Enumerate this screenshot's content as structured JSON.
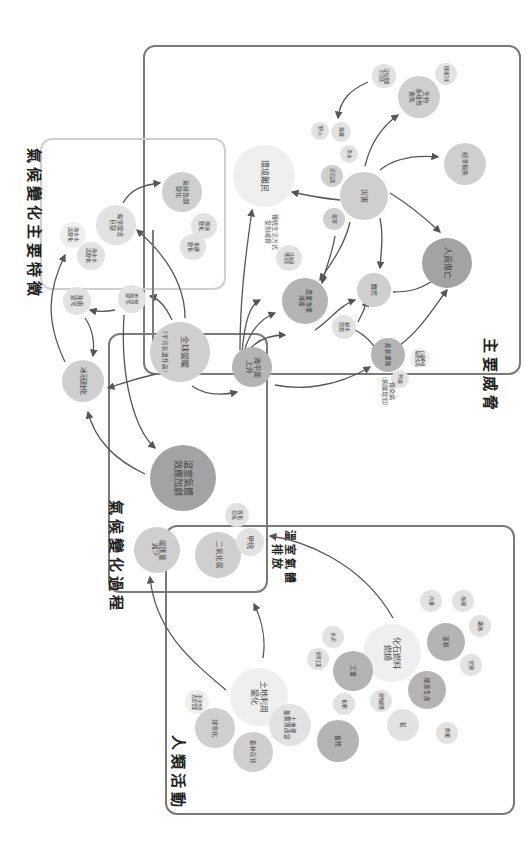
{
  "sections": {
    "features": "氣候變化主要特徵",
    "threats": "主要威脅",
    "process": "氣候變化過程",
    "ghg_emission": "溫室氣體\n排放",
    "human": "人類活動"
  },
  "nodes": {
    "ice_melt": "冰冠融化",
    "precip_change": "降雨\n變化",
    "sea_temp_change": "海水水\n溫變化",
    "ocean_current": "海洋環流\n巨變",
    "sea_level_change": "海水水\n溫變化",
    "cloud_change": "雲層\n變化",
    "extreme_weather": "氣候急劇\n變化",
    "wind_change": "風速\n變化",
    "season_change": "季節\n變化",
    "global_warming": "全球變暖",
    "global_warming_sub": "（平均氣溫升高）",
    "sea_level_rise": "海平面\n上升",
    "greenhouse_effect": "溫室氣體\n效應加劇",
    "carbon_sink": "碳匯量\n減少",
    "co2": "二氧化碳",
    "methane": "甲烷",
    "nitrous_oxide": "氧化\n亞氮",
    "env_refugees": "環境難民",
    "disaster": "災害",
    "fire": "野火",
    "drought": "乾旱",
    "flood": "洪水",
    "storm": "風暴",
    "landslide": "泥石流",
    "biodiversity": "生物\n多樣性\n喪失",
    "coral": "珊瑚白化",
    "habitat_loss": "沒有適應\n的消失",
    "economic_loss": "經濟損失",
    "human_death": "人員傷亡",
    "agri_fishery": "農業漁業\n減產",
    "hunger": "饑荒",
    "water_shortage": "缺水\n問題",
    "disease": "疾病擴散",
    "lifestyle_change": "傳統生活方式\n受到威脅",
    "coast_erosion": "沿海濕\n地消失",
    "heatwave": "熱浪",
    "vector_disease": "傳染病\n（病媒增加）",
    "respiratory": "心臟呼吸\n系統疾病",
    "land_use": "土地利用\n變化",
    "urbanisation": "城市化",
    "impervious": "不可滲透\n表面增加",
    "deforestation": "森林砍伐",
    "land_cover": "土地覆\n蓋類別改變",
    "fossil_fuel": "化石燃料\n燃燒",
    "industry": "工業",
    "chemical": "化學工業",
    "cement": "水泥",
    "fertiliser": "化肥",
    "livestock": "畜牧",
    "waste": "廢物處理",
    "energy": "能源生產",
    "rice": "稻",
    "transport": "運輸",
    "car": "汽車",
    "shipping": "海運",
    "rail": "鐵路",
    "aviation": "空運",
    "heating": "供暖"
  },
  "colors": {
    "frame_dark": "#7a7a7a",
    "frame_light": "#cfcfcf",
    "arrow": "#555555",
    "node_light": "#efefef",
    "node_mid": "#cfcfcf",
    "node_dark": "#b4b4b4"
  }
}
